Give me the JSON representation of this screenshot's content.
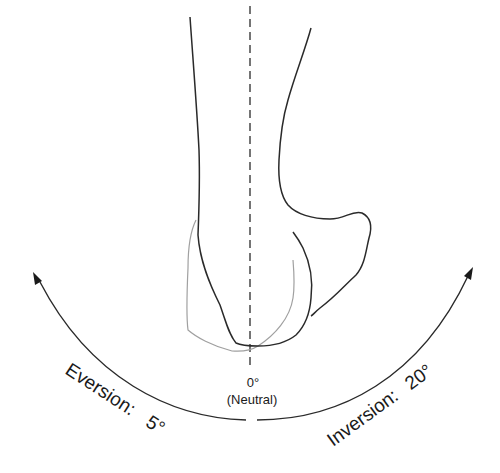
{
  "diagram": {
    "neutral": {
      "angle_label": "0°",
      "description": "(Neutral)"
    },
    "eversion": {
      "label": "Eversion:",
      "value": "5°"
    },
    "inversion": {
      "label": "Inversion:",
      "value": "20°"
    },
    "colors": {
      "outline": "#2a2a2a",
      "secondary_outline": "#9a9a9a",
      "text": "#1a1a1a",
      "background": "#ffffff"
    }
  }
}
